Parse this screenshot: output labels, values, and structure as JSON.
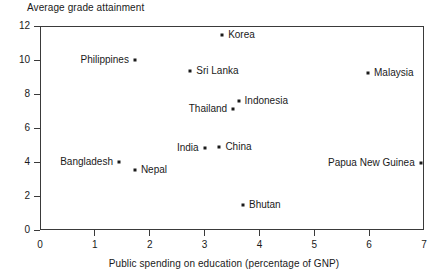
{
  "chart_data": {
    "type": "scatter",
    "title": "",
    "xlabel": "Public spending on education (percentage of GNP)",
    "ylabel": "Average grade attainment",
    "xlim": [
      0,
      7
    ],
    "ylim": [
      0,
      12
    ],
    "xticks": [
      "0",
      "1",
      "2",
      "3",
      "4",
      "5",
      "6",
      "7"
    ],
    "yticks": [
      "0",
      "2",
      "4",
      "6",
      "8",
      "10",
      "12"
    ],
    "grid": false,
    "legend": "none",
    "marker_color": "#1a1a1a",
    "axis_color": "#3a3a3a",
    "points": [
      {
        "label": "Korea",
        "x": 3.32,
        "y": 11.5,
        "label_side": "right"
      },
      {
        "label": "Philippines",
        "x": 1.73,
        "y": 10.0,
        "label_side": "left"
      },
      {
        "label": "Sri Lanka",
        "x": 2.74,
        "y": 9.35,
        "label_side": "right"
      },
      {
        "label": "Malaysia",
        "x": 5.98,
        "y": 9.25,
        "label_side": "right"
      },
      {
        "label": "Indonesia",
        "x": 3.62,
        "y": 7.6,
        "label_side": "right"
      },
      {
        "label": "Thailand",
        "x": 3.52,
        "y": 7.1,
        "label_side": "left"
      },
      {
        "label": "China",
        "x": 3.27,
        "y": 4.9,
        "label_side": "right"
      },
      {
        "label": "India",
        "x": 3.0,
        "y": 4.8,
        "label_side": "left"
      },
      {
        "label": "Bangladesh",
        "x": 1.44,
        "y": 4.0,
        "label_side": "left"
      },
      {
        "label": "Papua New Guinea",
        "x": 6.94,
        "y": 3.95,
        "label_side": "left"
      },
      {
        "label": "Nepal",
        "x": 1.73,
        "y": 3.52,
        "label_side": "right"
      },
      {
        "label": "Bhutan",
        "x": 3.7,
        "y": 1.5,
        "label_side": "right"
      }
    ]
  }
}
